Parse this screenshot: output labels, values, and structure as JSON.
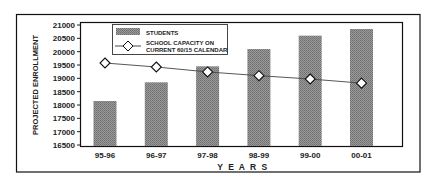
{
  "chart_data": {
    "type": "bar",
    "title": "",
    "xlabel": "YEARS",
    "ylabel": "PROJECTED ENROLLMENT",
    "categories": [
      "95-96",
      "96-97",
      "97-98",
      "98-99",
      "99-00",
      "00-01"
    ],
    "series": [
      {
        "name": "STUDENTS",
        "kind": "bar",
        "values": [
          18150,
          18850,
          19450,
          20100,
          20600,
          20850
        ]
      },
      {
        "name": "SCHOOL CAPACITY ON CURRENT 60/15 CALENDAR",
        "kind": "line",
        "marker": "diamond",
        "values": [
          19575,
          19425,
          19240,
          19100,
          18975,
          18820
        ]
      }
    ],
    "ylim": [
      16500,
      21000
    ],
    "yticks": [
      16500,
      17000,
      17500,
      18000,
      18500,
      19000,
      19500,
      20000,
      20500,
      21000
    ],
    "grid": false,
    "legend_position": "top-left inside"
  },
  "legend": {
    "students_label": "STUDENTS",
    "capacity_label_line1": "SCHOOL CAPACITY ON",
    "capacity_label_line2": "CURRENT 60/15 CALENDAR"
  },
  "axes": {
    "xlabel": "Y E A R S",
    "ylabel": "PROJECTED ENROLLMENT"
  },
  "colors": {
    "bar": "#8a8a8a",
    "line": "#444444",
    "frame": "#111111"
  }
}
